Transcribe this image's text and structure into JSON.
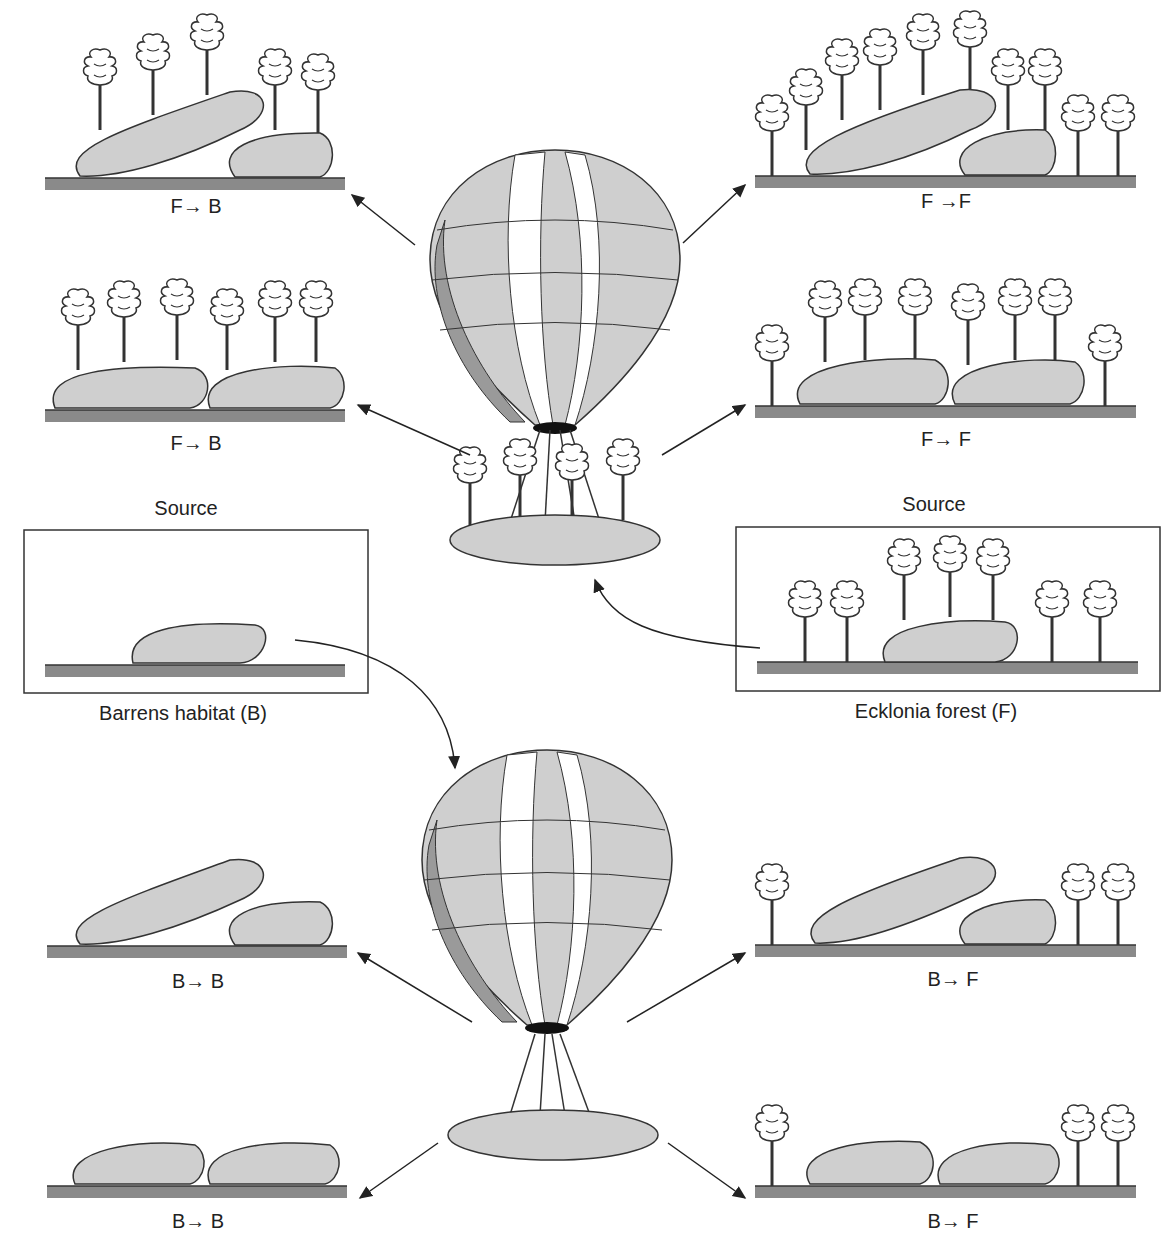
{
  "diagram": {
    "type": "kelp-transplant-experiment",
    "sources": {
      "barrens": {
        "heading": "Source",
        "caption": "Barrens habitat (B)"
      },
      "forest": {
        "heading": "Source",
        "caption": "Ecklonia forest (F)"
      }
    },
    "outcomes": {
      "top_left_1": "F→ B",
      "top_left_2": "F→ B",
      "top_right_1": "F →F",
      "top_right_2": "F→ F",
      "bottom_left_1": "B→ B",
      "bottom_left_2": "B→ B",
      "bottom_right_1": "B→ F",
      "bottom_right_2": "B→ F"
    },
    "colors": {
      "rock": "#cfcfcf",
      "ground": "#8a8a8a",
      "balloon_dark": "#9a9a9a",
      "balloon_mid": "#cccccc",
      "outline": "#333333"
    }
  }
}
